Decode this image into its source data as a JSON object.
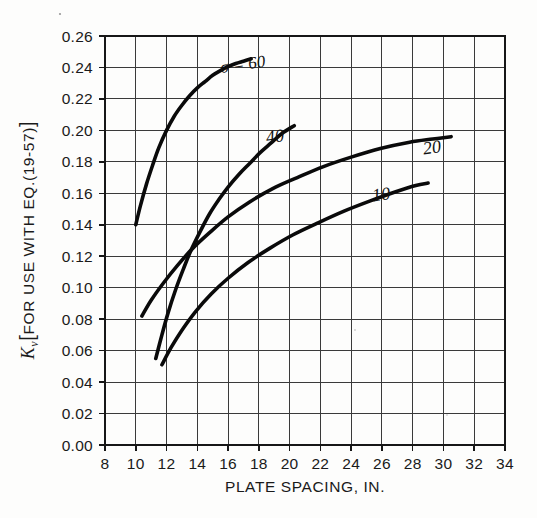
{
  "chart_data": {
    "type": "line",
    "title": "",
    "xlabel": "PLATE SPACING, IN.",
    "ylabel": "Kv [FOR USE WITH EQ.(19-57)]",
    "ylabel_parts": {
      "symbol": "K",
      "subscript": "v",
      "bracket_open": "[",
      "text": "FOR USE WITH EQ.(19-57)",
      "bracket_close": "]"
    },
    "xlim": [
      8,
      34
    ],
    "ylim": [
      0.0,
      0.26
    ],
    "xticks": [
      8,
      10,
      12,
      14,
      16,
      18,
      20,
      22,
      24,
      26,
      28,
      30,
      32,
      34
    ],
    "yticks": [
      0.0,
      0.02,
      0.04,
      0.06,
      0.08,
      0.1,
      0.12,
      0.14,
      0.16,
      0.18,
      0.2,
      0.22,
      0.24,
      0.26
    ],
    "xtick_labels": [
      "8",
      "10",
      "12",
      "14",
      "16",
      "18",
      "20",
      "22",
      "24",
      "26",
      "28",
      "30",
      "32",
      "34"
    ],
    "ytick_labels": [
      "0.00",
      "0.02",
      "0.04",
      "0.06",
      "0.08",
      "0.10",
      "0.12",
      "0.14",
      "0.16",
      "0.18",
      "0.20",
      "0.22",
      "0.24",
      "0.26"
    ],
    "grid": true,
    "grid_both_axes": true,
    "legend": "inline-curve-labels",
    "legend_position": "on-curve",
    "line_color": "#0a0a0a",
    "grid_color": "#3a3a3a",
    "axis_color": "#171717",
    "background_color": "#fdfdfc",
    "series": [
      {
        "name": "sigma = 60",
        "label": "σ = 60",
        "label_x": 17.0,
        "label_y": 0.2385,
        "sigma": 60,
        "x": [
          10.0,
          10.3,
          10.7,
          11.1,
          11.5,
          12.0,
          12.5,
          13.0,
          13.5,
          14.0,
          14.5,
          15.0,
          15.5,
          16.0,
          16.5,
          17.0,
          17.5
        ],
        "y": [
          0.14,
          0.152,
          0.166,
          0.178,
          0.189,
          0.2,
          0.209,
          0.216,
          0.222,
          0.227,
          0.231,
          0.235,
          0.238,
          0.2405,
          0.2425,
          0.244,
          0.2455
        ]
      },
      {
        "name": "sigma = 40",
        "label": "40",
        "label_x": 19.1,
        "label_y": 0.1925,
        "sigma": 40,
        "x": [
          11.3,
          11.7,
          12.1,
          12.6,
          13.1,
          13.6,
          14.2,
          14.8,
          15.4,
          16.0,
          16.7,
          17.4,
          18.1,
          18.8,
          19.5,
          20.3
        ],
        "y": [
          0.055,
          0.07,
          0.084,
          0.099,
          0.112,
          0.124,
          0.136,
          0.147,
          0.156,
          0.164,
          0.172,
          0.179,
          0.186,
          0.192,
          0.198,
          0.203
        ]
      },
      {
        "name": "sigma = 20",
        "label": "20",
        "label_x": 29.3,
        "label_y": 0.1855,
        "sigma": 20,
        "x": [
          10.4,
          11.0,
          11.8,
          12.7,
          13.7,
          14.8,
          16.0,
          17.4,
          18.9,
          20.5,
          22.2,
          24.0,
          25.9,
          27.8,
          29.3,
          30.5
        ],
        "y": [
          0.082,
          0.092,
          0.103,
          0.114,
          0.125,
          0.135,
          0.145,
          0.1545,
          0.163,
          0.17,
          0.177,
          0.183,
          0.1885,
          0.1925,
          0.1945,
          0.196
        ]
      },
      {
        "name": "sigma = 10",
        "label": "10",
        "label_x": 26.0,
        "label_y": 0.1555,
        "sigma": 10,
        "x": [
          11.7,
          12.3,
          13.0,
          13.9,
          14.9,
          16.0,
          17.3,
          18.7,
          20.2,
          21.8,
          23.5,
          25.2,
          26.9,
          28.2,
          29.0
        ],
        "y": [
          0.051,
          0.062,
          0.073,
          0.085,
          0.096,
          0.106,
          0.116,
          0.125,
          0.1335,
          0.141,
          0.1485,
          0.155,
          0.161,
          0.165,
          0.1665
        ]
      }
    ]
  },
  "figure": {
    "plot_left_px": 105,
    "plot_right_px": 505,
    "plot_top_px": 36,
    "plot_bottom_px": 445
  }
}
